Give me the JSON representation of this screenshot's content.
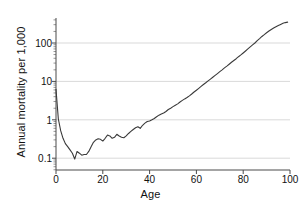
{
  "chart_data": {
    "type": "line",
    "title": "",
    "xlabel": "Age",
    "ylabel": "Annual mortality per 1,000",
    "yscale": "log",
    "xscale": "linear",
    "xlim": [
      0,
      100
    ],
    "ylim": [
      0.07,
      500
    ],
    "grid": "horizontal",
    "legend": "none",
    "x_ticks": [
      "0",
      "20",
      "40",
      "60",
      "80",
      "100"
    ],
    "x_tick_values": [
      0,
      20,
      40,
      60,
      80,
      100
    ],
    "y_ticks": [
      "0.1",
      "1",
      "10",
      "100"
    ],
    "y_tick_values": [
      0.1,
      1,
      10,
      100
    ],
    "series": [
      {
        "name": "Annual mortality per 1,000",
        "color": "#3a3a3a",
        "x": [
          0,
          1,
          2,
          3,
          4,
          5,
          6,
          7,
          8,
          9,
          10,
          11,
          12,
          13,
          14,
          15,
          16,
          17,
          18,
          19,
          20,
          21,
          22,
          23,
          24,
          25,
          26,
          27,
          28,
          29,
          30,
          31,
          32,
          33,
          34,
          35,
          36,
          37,
          38,
          39,
          40,
          41,
          42,
          43,
          44,
          45,
          46,
          47,
          48,
          49,
          50,
          51,
          52,
          53,
          54,
          55,
          56,
          57,
          58,
          59,
          60,
          61,
          62,
          63,
          64,
          65,
          66,
          67,
          68,
          69,
          70,
          71,
          72,
          73,
          74,
          75,
          76,
          77,
          78,
          79,
          80,
          81,
          82,
          83,
          84,
          85,
          86,
          87,
          88,
          89,
          90,
          91,
          92,
          93,
          94,
          95,
          96,
          97,
          98,
          99
        ],
        "y": [
          6.2,
          1.05,
          0.52,
          0.33,
          0.24,
          0.2,
          0.165,
          0.135,
          0.095,
          0.15,
          0.135,
          0.12,
          0.125,
          0.125,
          0.15,
          0.2,
          0.26,
          0.3,
          0.32,
          0.31,
          0.28,
          0.33,
          0.4,
          0.38,
          0.33,
          0.35,
          0.42,
          0.38,
          0.35,
          0.34,
          0.38,
          0.44,
          0.5,
          0.56,
          0.62,
          0.66,
          0.6,
          0.72,
          0.82,
          0.9,
          0.93,
          1.0,
          1.08,
          1.2,
          1.32,
          1.42,
          1.5,
          1.65,
          1.85,
          2.0,
          2.2,
          2.4,
          2.6,
          2.9,
          3.2,
          3.5,
          3.8,
          4.2,
          4.7,
          5.3,
          5.9,
          6.6,
          7.4,
          8.3,
          9.2,
          10.3,
          11.5,
          12.8,
          14.3,
          16.0,
          18.0,
          20.0,
          22.5,
          25.0,
          28.0,
          31.5,
          35.0,
          39.0,
          44.0,
          49.0,
          55.0,
          62.0,
          70.0,
          79.0,
          89.0,
          100.0,
          115.0,
          130.0,
          148.0,
          165.0,
          185.0,
          205.0,
          225.0,
          245.0,
          265.0,
          285.0,
          305.0,
          325.0,
          340.0,
          350.0
        ]
      }
    ]
  },
  "axes": {
    "x_title": "Age",
    "y_title": "Annual mortality per 1,000"
  }
}
